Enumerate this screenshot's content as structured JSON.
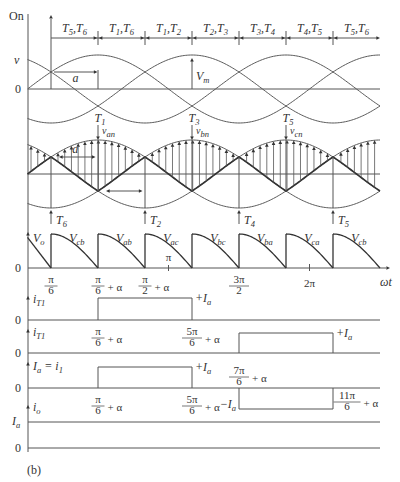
{
  "figure": {
    "caption": "(b)",
    "x_axis_label": "ωt",
    "angle_range_deg": [
      0,
      450
    ],
    "alpha_deg": 60
  },
  "conduction": {
    "axis_label": "On",
    "intervals": [
      {
        "label": [
          {
            "t": "T"
          },
          {
            "sub": "5"
          },
          {
            "t": ",T"
          },
          {
            "sub": "6"
          }
        ],
        "start_deg": 30,
        "end_deg": 90
      },
      {
        "label": [
          {
            "t": "T"
          },
          {
            "sub": "1"
          },
          {
            "t": ",T"
          },
          {
            "sub": "6"
          }
        ],
        "start_deg": 90,
        "end_deg": 150
      },
      {
        "label": [
          {
            "t": "T"
          },
          {
            "sub": "1"
          },
          {
            "t": ",T"
          },
          {
            "sub": "2"
          }
        ],
        "start_deg": 150,
        "end_deg": 210
      },
      {
        "label": [
          {
            "t": "T"
          },
          {
            "sub": "2"
          },
          {
            "t": ",T"
          },
          {
            "sub": "3"
          }
        ],
        "start_deg": 210,
        "end_deg": 270
      },
      {
        "label": [
          {
            "t": "T"
          },
          {
            "sub": "3"
          },
          {
            "t": ",T"
          },
          {
            "sub": "4"
          }
        ],
        "start_deg": 270,
        "end_deg": 330
      },
      {
        "label": [
          {
            "t": "T"
          },
          {
            "sub": "4"
          },
          {
            "t": ",T"
          },
          {
            "sub": "5"
          }
        ],
        "start_deg": 330,
        "end_deg": 390
      },
      {
        "label": [
          {
            "t": "T"
          },
          {
            "sub": "5"
          },
          {
            "t": ",T"
          },
          {
            "sub": "6"
          }
        ],
        "start_deg": 390,
        "end_deg": 450
      }
    ]
  },
  "phase_panel": {
    "y_label": "v",
    "zero_label": "0",
    "phase_peaks_deg": {
      "a": 90,
      "b": 210,
      "c": 330
    },
    "alpha_label": "a",
    "alpha_from_deg": 30,
    "alpha_to_deg": 90,
    "vm_label": [
      {
        "t": "V"
      },
      {
        "sub": "m"
      }
    ],
    "vm_at_deg": 210
  },
  "firing_panel": {
    "alpha_label": "a",
    "alpha_arrows": [
      {
        "from_deg": 30,
        "to_deg": 90,
        "level": 0.5,
        "labeled": true
      },
      {
        "from_deg": 90,
        "to_deg": 150,
        "level": -0.5,
        "labeled": false
      }
    ],
    "top_firings": [
      {
        "angle_deg": 90,
        "label": [
          {
            "t": "T"
          },
          {
            "sub": "1"
          }
        ],
        "voltage": [
          {
            "t": "v"
          },
          {
            "sub": "an"
          }
        ]
      },
      {
        "angle_deg": 210,
        "label": [
          {
            "t": "T"
          },
          {
            "sub": "3"
          }
        ],
        "voltage": [
          {
            "t": "v"
          },
          {
            "sub": "bn"
          }
        ]
      },
      {
        "angle_deg": 330,
        "label": [
          {
            "t": "T"
          },
          {
            "sub": "5"
          }
        ],
        "voltage": [
          {
            "t": "v"
          },
          {
            "sub": "cn"
          }
        ]
      }
    ],
    "bottom_firings": [
      {
        "angle_deg": 30,
        "label": [
          {
            "t": "T"
          },
          {
            "sub": "6"
          }
        ]
      },
      {
        "angle_deg": 150,
        "label": [
          {
            "t": "T"
          },
          {
            "sub": "2"
          }
        ]
      },
      {
        "angle_deg": 270,
        "label": [
          {
            "t": "T"
          },
          {
            "sub": "4"
          }
        ]
      },
      {
        "angle_deg": 390,
        "label": [
          {
            "t": "T"
          },
          {
            "sub": "5"
          }
        ]
      }
    ]
  },
  "output_panel": {
    "y_label": [
      {
        "t": "V"
      },
      {
        "sub": "o"
      }
    ],
    "zero_label": "0",
    "segments": [
      {
        "label": [
          {
            "t": "V"
          },
          {
            "sub": "cb"
          }
        ],
        "start_deg": 30,
        "end_deg": 90
      },
      {
        "label": [
          {
            "t": "V"
          },
          {
            "sub": "ab"
          }
        ],
        "start_deg": 90,
        "end_deg": 150
      },
      {
        "label": [
          {
            "t": "V"
          },
          {
            "sub": "ac"
          }
        ],
        "start_deg": 150,
        "end_deg": 210
      },
      {
        "label": [
          {
            "t": "V"
          },
          {
            "sub": "bc"
          }
        ],
        "start_deg": 210,
        "end_deg": 270
      },
      {
        "label": [
          {
            "t": "V"
          },
          {
            "sub": "ba"
          }
        ],
        "start_deg": 270,
        "end_deg": 330
      },
      {
        "label": [
          {
            "t": "V"
          },
          {
            "sub": "ca"
          }
        ],
        "start_deg": 330,
        "end_deg": 390
      },
      {
        "label": [
          {
            "t": "V"
          },
          {
            "sub": "cb"
          }
        ],
        "start_deg": 390,
        "end_deg": 450
      }
    ],
    "ticks": [
      {
        "num": "π",
        "den": "6",
        "suffix": "",
        "angle_deg": 30,
        "place": "below"
      },
      {
        "num": "π",
        "den": "6",
        "suffix": "+ α",
        "angle_deg": 90,
        "place": "below"
      },
      {
        "num": "π",
        "den": "2",
        "suffix": "+ α",
        "angle_deg": 150,
        "place": "below"
      },
      {
        "text": "π",
        "angle_deg": 180,
        "place": "above"
      },
      {
        "num": "3π",
        "den": "2",
        "suffix": "",
        "angle_deg": 270,
        "place": "below"
      },
      {
        "text": "2π",
        "angle_deg": 360,
        "place": "below"
      }
    ]
  },
  "current_panels": [
    {
      "y_label": [
        {
          "t": "i"
        },
        {
          "sub": "T1"
        }
      ],
      "zero_label": "0",
      "pulses": [
        {
          "start_deg": 90,
          "end_deg": 210,
          "level": 1,
          "level_label": [
            {
              "t": "+I"
            },
            {
              "sub": "a"
            }
          ],
          "level_label_side": "right"
        }
      ],
      "ticks": [
        {
          "num": "π",
          "den": "6",
          "suffix": "+ α",
          "angle_deg": 90,
          "place": "below"
        },
        {
          "num": "5π",
          "den": "6",
          "suffix": "+ α",
          "angle_deg": 210,
          "place": "below"
        }
      ]
    },
    {
      "y_label": [
        {
          "t": "i"
        },
        {
          "sub": "T1"
        }
      ],
      "zero_label": "0",
      "pulses": [
        {
          "start_deg": 270,
          "end_deg": 390,
          "level": 1,
          "level_label": [
            {
              "t": "+I"
            },
            {
              "sub": "a"
            }
          ],
          "level_label_side": "right"
        }
      ],
      "ticks": []
    },
    {
      "y_label": [
        {
          "t": "I"
        },
        {
          "sub": "a"
        },
        {
          "t": " = i"
        },
        {
          "sub": "1"
        }
      ],
      "zero_label": "0",
      "pulses": [
        {
          "start_deg": 90,
          "end_deg": 210,
          "level": 1,
          "level_label": [
            {
              "t": "+I"
            },
            {
              "sub": "a"
            }
          ],
          "level_label_side": "right"
        },
        {
          "start_deg": 270,
          "end_deg": 390,
          "level": -1,
          "level_label": [
            {
              "t": "−I"
            },
            {
              "sub": "a"
            }
          ],
          "level_label_side": "left"
        }
      ],
      "ticks": [
        {
          "num": "π",
          "den": "6",
          "suffix": "+ α",
          "angle_deg": 90,
          "place": "below"
        },
        {
          "num": "5π",
          "den": "6",
          "suffix": "+ α",
          "angle_deg": 210,
          "place": "below"
        },
        {
          "num": "7π",
          "den": "6",
          "suffix": "+ α",
          "angle_deg": 270,
          "place": "above"
        },
        {
          "num": "11π",
          "den": "6",
          "suffix": "+ α",
          "angle_deg": 390,
          "place": "right"
        }
      ]
    },
    {
      "y_label": [
        {
          "t": "i"
        },
        {
          "sub": "o"
        }
      ],
      "zero_label": "0",
      "level_axis_label": [
        {
          "t": "I"
        },
        {
          "sub": "a"
        }
      ],
      "constant_level": 1,
      "pulses": [],
      "ticks": []
    }
  ]
}
